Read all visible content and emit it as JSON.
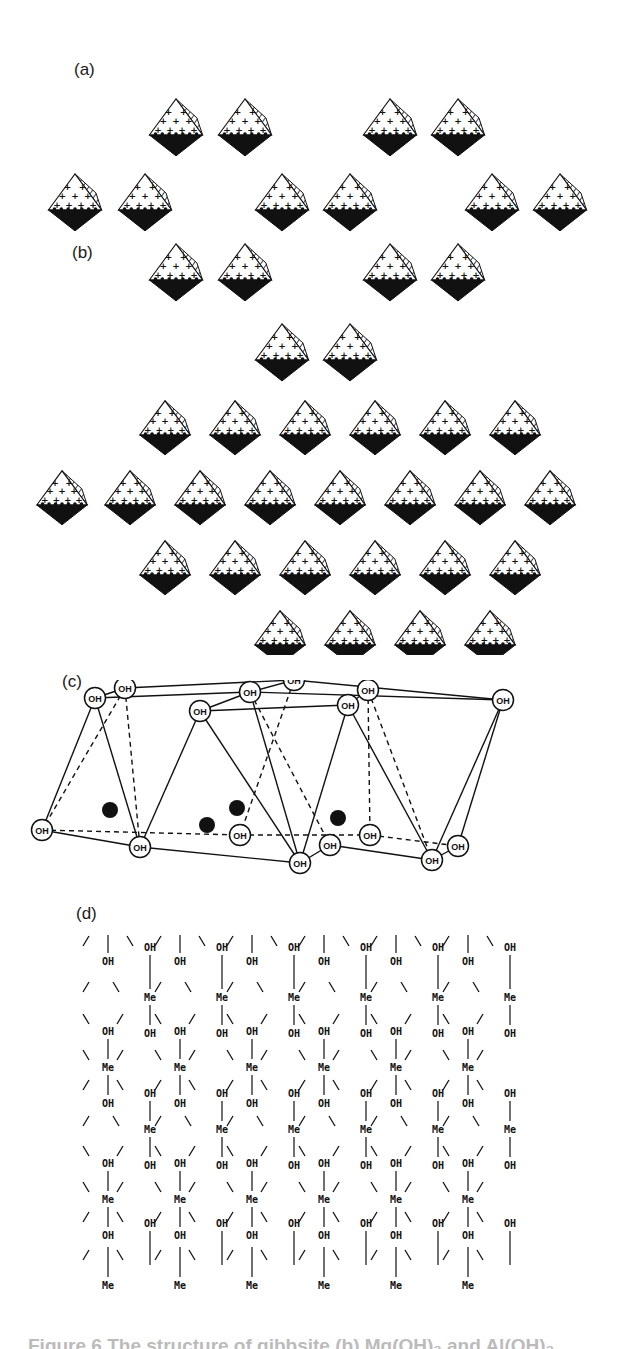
{
  "figure": {
    "panels": [
      {
        "label": "(a)",
        "description": "gibbsite-type layer of edge-sharing octahedra, plan view with hexagonal vacancies"
      },
      {
        "label": "(b)",
        "description": "brucite-type fully occupied octahedral layer"
      },
      {
        "label": "(c)",
        "description": "perspective view of octahedral sheet with OH corners and central cations"
      },
      {
        "label": "(d)",
        "description": "schematic Me–OH layer network"
      }
    ],
    "node_labels": {
      "hydroxyl": "OH",
      "metal": "Me"
    },
    "caption": "Figure 6   The structure of gibbsite (b) Mg(OH)₂ and Al(OH)₃"
  },
  "colors": {
    "ink": "#111111",
    "paper": "#ffffff",
    "caption": "#bbbbbb"
  }
}
